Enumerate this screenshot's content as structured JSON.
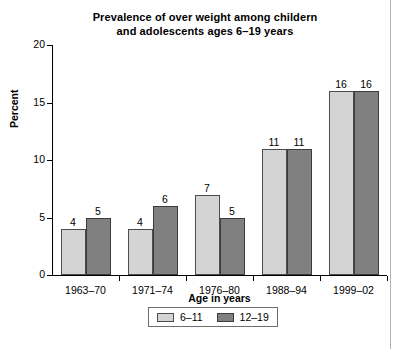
{
  "chart_data": {
    "type": "bar",
    "title": "Prevalence of over weight among childern and adolescents ages 6–19 years",
    "title_lines": [
      "Prevalence of over weight among childern",
      "and adolescents ages 6–19 years"
    ],
    "xlabel": "Age in years",
    "ylabel": "Percent",
    "categories": [
      "1963–70",
      "1971–74",
      "1976–80",
      "1988–94",
      "1999–02"
    ],
    "series": [
      {
        "name": "6–11",
        "color": "#d4d4d4",
        "values": [
          4,
          4,
          7,
          11,
          16
        ]
      },
      {
        "name": "12–19",
        "color": "#808080",
        "values": [
          5,
          6,
          5,
          11,
          16
        ]
      }
    ],
    "ylim": [
      0,
      20
    ],
    "yticks": [
      0,
      5,
      10,
      15,
      20
    ],
    "ytick_labels": [
      "0",
      "5",
      "10",
      "15",
      "20"
    ],
    "grid": false,
    "legend_position": "bottom",
    "data_labels": true
  }
}
